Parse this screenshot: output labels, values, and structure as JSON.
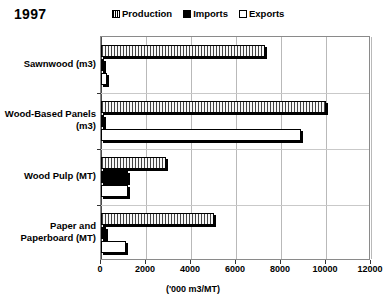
{
  "title": "1997",
  "legend": {
    "position": "top",
    "items": [
      {
        "label": "Production",
        "swatch": "hatched-square-icon"
      },
      {
        "label": "Imports",
        "swatch": "filled-square-icon"
      },
      {
        "label": "Exports",
        "swatch": "empty-square-icon"
      }
    ]
  },
  "axis": {
    "x_title": "('000 m3/MT)",
    "x_ticks": [
      "0",
      "2000",
      "4000",
      "6000",
      "8000",
      "10000",
      "12000"
    ]
  },
  "chart_data": {
    "type": "bar",
    "orientation": "horizontal",
    "title": "1997",
    "xlabel": "('000 m3/MT)",
    "ylabel": "",
    "xlim": [
      0,
      12000
    ],
    "xticks": [
      0,
      2000,
      4000,
      6000,
      8000,
      10000,
      12000
    ],
    "grid": true,
    "legend_position": "top",
    "categories": [
      "Sawnwood (m3)",
      "Wood-Based Panels (m3)",
      "Wood Pulp (MT)",
      "Paper and Paperboard (MT)"
    ],
    "series": [
      {
        "name": "Production",
        "values": [
          7300,
          10000,
          2900,
          5000
        ]
      },
      {
        "name": "Imports",
        "values": [
          100,
          100,
          1200,
          200
        ]
      },
      {
        "name": "Exports",
        "values": [
          250,
          8900,
          1200,
          1100
        ]
      }
    ]
  }
}
